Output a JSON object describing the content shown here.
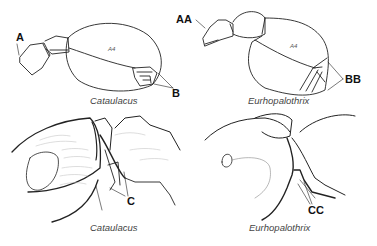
{
  "figure": {
    "panels": [
      {
        "id": "top-left",
        "caption": "Cataulacus",
        "labels": {
          "a": "A",
          "b": "B",
          "segment": "A4"
        }
      },
      {
        "id": "top-right",
        "caption": "Eurhopalothrix",
        "labels": {
          "a": "AA",
          "b": "BB",
          "segment": "A4"
        }
      },
      {
        "id": "bottom-left",
        "caption": "Cataulacus",
        "labels": {
          "c": "C"
        }
      },
      {
        "id": "bottom-right",
        "caption": "Eurhopalothrix",
        "labels": {
          "c": "CC"
        }
      }
    ],
    "line_color": "#222222",
    "hatch_color": "#bbbbbb"
  }
}
